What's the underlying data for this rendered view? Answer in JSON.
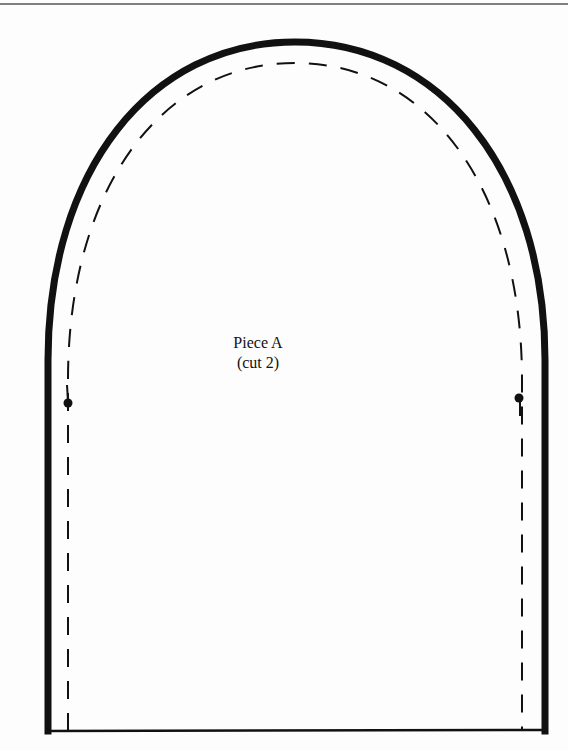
{
  "pattern": {
    "piece_name": "Piece A",
    "cut_instruction": "(cut 2)",
    "colors": {
      "outline": "#111111",
      "background": "#fdfdfd",
      "top_rule": "#555555"
    },
    "markings": {
      "cutting_line": "solid-thick",
      "seam_line": "dashed",
      "notch_dots": 2
    }
  }
}
